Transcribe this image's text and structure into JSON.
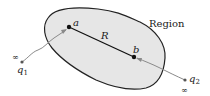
{
  "diagram": {
    "region_label": "Region",
    "points": [
      {
        "name": "a",
        "label": "a"
      },
      {
        "name": "b",
        "label": "b"
      }
    ],
    "segment_label": "R",
    "charges": [
      {
        "name": "q1",
        "label": "q",
        "subscript": "1",
        "infinity": "∞"
      },
      {
        "name": "q2",
        "label": "q",
        "subscript": "2",
        "infinity": "∞"
      }
    ],
    "colors": {
      "region_fill": "#e6e6e6",
      "region_stroke": "#222222",
      "segment": "#111111",
      "path": "#8a8a8a"
    }
  }
}
